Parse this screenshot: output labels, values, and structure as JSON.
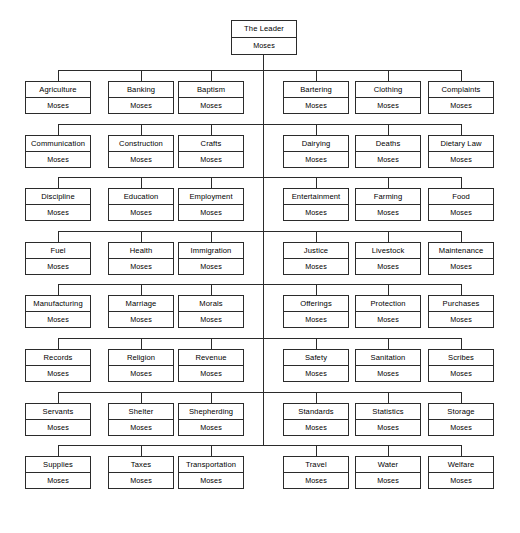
{
  "chart": {
    "type": "organizational-tree",
    "orientation": "vertical-spine-with-lateral-rows",
    "person_name": "Moses",
    "root": {
      "title": "The Leader",
      "person": "Moses"
    },
    "columns_per_side": 3,
    "row_count": 8,
    "colors": {
      "line": "#2b2b2b",
      "border": "#2b2b2b",
      "background": "#ffffff",
      "text": "#000000"
    },
    "rows": [
      {
        "left": [
          {
            "title": "Agriculture",
            "person": "Moses"
          },
          {
            "title": "Banking",
            "person": "Moses"
          },
          {
            "title": "Baptism",
            "person": "Moses"
          }
        ],
        "right": [
          {
            "title": "Bartering",
            "person": "Moses"
          },
          {
            "title": "Clothing",
            "person": "Moses"
          },
          {
            "title": "Complaints",
            "person": "Moses"
          }
        ]
      },
      {
        "left": [
          {
            "title": "Communication",
            "person": "Moses"
          },
          {
            "title": "Construction",
            "person": "Moses"
          },
          {
            "title": "Crafts",
            "person": "Moses"
          }
        ],
        "right": [
          {
            "title": "Dairying",
            "person": "Moses"
          },
          {
            "title": "Deaths",
            "person": "Moses"
          },
          {
            "title": "Dietary Law",
            "person": "Moses"
          }
        ]
      },
      {
        "left": [
          {
            "title": "Discipline",
            "person": "Moses"
          },
          {
            "title": "Education",
            "person": "Moses"
          },
          {
            "title": "Employment",
            "person": "Moses"
          }
        ],
        "right": [
          {
            "title": "Entertainment",
            "person": "Moses"
          },
          {
            "title": "Farming",
            "person": "Moses"
          },
          {
            "title": "Food",
            "person": "Moses"
          }
        ]
      },
      {
        "left": [
          {
            "title": "Fuel",
            "person": "Moses"
          },
          {
            "title": "Health",
            "person": "Moses"
          },
          {
            "title": "Immigration",
            "person": "Moses"
          }
        ],
        "right": [
          {
            "title": "Justice",
            "person": "Moses"
          },
          {
            "title": "Livestock",
            "person": "Moses"
          },
          {
            "title": "Maintenance",
            "person": "Moses"
          }
        ]
      },
      {
        "left": [
          {
            "title": "Manufacturing",
            "person": "Moses"
          },
          {
            "title": "Marriage",
            "person": "Moses"
          },
          {
            "title": "Morals",
            "person": "Moses"
          }
        ],
        "right": [
          {
            "title": "Offerings",
            "person": "Moses"
          },
          {
            "title": "Protection",
            "person": "Moses"
          },
          {
            "title": "Purchases",
            "person": "Moses"
          }
        ]
      },
      {
        "left": [
          {
            "title": "Records",
            "person": "Moses"
          },
          {
            "title": "Religion",
            "person": "Moses"
          },
          {
            "title": "Revenue",
            "person": "Moses"
          }
        ],
        "right": [
          {
            "title": "Safety",
            "person": "Moses"
          },
          {
            "title": "Sanitation",
            "person": "Moses"
          },
          {
            "title": "Scribes",
            "person": "Moses"
          }
        ]
      },
      {
        "left": [
          {
            "title": "Servants",
            "person": "Moses"
          },
          {
            "title": "Shelter",
            "person": "Moses"
          },
          {
            "title": "Shepherding",
            "person": "Moses"
          }
        ],
        "right": [
          {
            "title": "Standards",
            "person": "Moses"
          },
          {
            "title": "Statistics",
            "person": "Moses"
          },
          {
            "title": "Storage",
            "person": "Moses"
          }
        ]
      },
      {
        "left": [
          {
            "title": "Supplies",
            "person": "Moses"
          },
          {
            "title": "Taxes",
            "person": "Moses"
          },
          {
            "title": "Transportation",
            "person": "Moses"
          }
        ],
        "right": [
          {
            "title": "Travel",
            "person": "Moses"
          },
          {
            "title": "Water",
            "person": "Moses"
          },
          {
            "title": "Welfare",
            "person": "Moses"
          }
        ]
      }
    ]
  }
}
